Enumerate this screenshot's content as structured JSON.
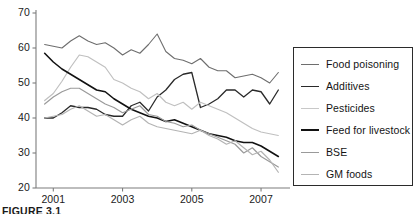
{
  "figure": {
    "caption": "FIGURE 3.1"
  },
  "chart_data": {
    "type": "line",
    "title": "",
    "xlabel": "",
    "ylabel": "",
    "xlim": [
      2000.5,
      2007.75
    ],
    "ylim": [
      20,
      70
    ],
    "grid": false,
    "legend_position": "right",
    "yticks": [
      20,
      30,
      40,
      50,
      60,
      70
    ],
    "xticks": [
      2001,
      2003,
      2005,
      2007
    ],
    "xtick_labels": [
      "2001",
      "2003",
      "2005",
      "2007"
    ],
    "ytick_labels": [
      "20",
      "30",
      "40",
      "50",
      "60",
      "70"
    ],
    "x": [
      2000.75,
      2001.0,
      2001.25,
      2001.5,
      2001.75,
      2002.0,
      2002.25,
      2002.5,
      2002.75,
      2003.0,
      2003.25,
      2003.5,
      2003.75,
      2004.0,
      2004.25,
      2004.5,
      2004.75,
      2005.0,
      2005.25,
      2005.5,
      2005.75,
      2006.0,
      2006.25,
      2006.5,
      2006.75,
      2007.0,
      2007.25,
      2007.5
    ],
    "series": [
      {
        "name": "Food poisoning",
        "color": "#6e6e6e",
        "width": 1.1,
        "values": [
          61,
          60.5,
          60,
          62,
          63.5,
          62,
          61,
          61.5,
          60,
          58,
          59.5,
          58.5,
          61,
          64,
          59,
          57,
          56.5,
          55.5,
          57,
          54.5,
          53.5,
          53.5,
          51.5,
          52,
          52.5,
          51.5,
          50,
          53
        ]
      },
      {
        "name": "Additives",
        "color": "#2a2a2a",
        "width": 1.3,
        "values": [
          40,
          40,
          41.5,
          43.5,
          43,
          43,
          42.5,
          41,
          40.5,
          40.5,
          43.5,
          44.5,
          42,
          46,
          48,
          51,
          52.5,
          53,
          43,
          44,
          45.5,
          48,
          48,
          46,
          48,
          47.5,
          44,
          48
        ]
      },
      {
        "name": "Pesticides",
        "color": "#c0c0c0",
        "width": 1.2,
        "values": [
          45,
          47,
          50.5,
          54.5,
          58,
          57.5,
          56,
          54.5,
          51,
          50,
          48.5,
          47.5,
          45.5,
          47,
          44.5,
          43.5,
          44.5,
          42.5,
          44.5,
          43.5,
          42.5,
          41.5,
          40,
          38.5,
          37,
          36,
          35.5,
          35
        ]
      },
      {
        "name": "Feed for livestock",
        "color": "#121212",
        "width": 1.6,
        "values": [
          58.5,
          56,
          54,
          52.5,
          51,
          49.5,
          48,
          47.5,
          45.5,
          44,
          42.5,
          41.5,
          40.5,
          40,
          39,
          39.5,
          38.5,
          37.5,
          36.5,
          35.5,
          35,
          34.5,
          33.5,
          33,
          33,
          32,
          30.5,
          29
        ]
      },
      {
        "name": "BSE",
        "color": "#9a9a9a",
        "width": 1.2,
        "values": [
          44,
          46,
          47.5,
          48.5,
          48.5,
          47,
          45.5,
          44,
          43,
          41.5,
          42.5,
          43.5,
          41,
          40.5,
          39,
          38.5,
          37.5,
          38,
          36.5,
          35.5,
          34.5,
          33.5,
          32.5,
          30,
          31.5,
          29,
          27.5,
          26
        ]
      },
      {
        "name": "GM foods",
        "color": "#b4b4b4",
        "width": 1.2,
        "values": [
          40,
          40.5,
          41,
          42.5,
          43.5,
          42,
          40.5,
          41,
          39.5,
          38,
          39.5,
          40.5,
          38.5,
          37.5,
          37,
          36.5,
          36,
          35.5,
          36.5,
          35,
          34,
          32.5,
          33.5,
          31.5,
          29.5,
          30.5,
          28,
          24.5
        ]
      }
    ]
  },
  "legend": {
    "items": [
      {
        "label": "Food poisoning",
        "color": "#6e6e6e",
        "width": "1.3px"
      },
      {
        "label": "Additives",
        "color": "#2a2a2a",
        "width": "1.7px"
      },
      {
        "label": "Pesticides",
        "color": "#c8c8c8",
        "width": "1.3px"
      },
      {
        "label": "Feed for livestock",
        "color": "#121212",
        "width": "2px"
      },
      {
        "label": "BSE",
        "color": "#9a9a9a",
        "width": "1.3px"
      },
      {
        "label": "GM foods",
        "color": "#b4b4b4",
        "width": "1.3px"
      }
    ]
  }
}
